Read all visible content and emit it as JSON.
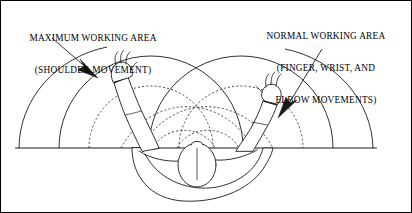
{
  "diagram": {
    "labels": {
      "maximum": {
        "name": "maximum-working-area-label",
        "line1": "MAXIMUM WORKING AREA",
        "line2": "(SHOULDER MOVEMENT)"
      },
      "normal": {
        "name": "normal-working-area-label",
        "line1": "NORMAL WORKING AREA",
        "line2": "(FINGER, WRIST, AND",
        "line3": "ELBOW MOVEMENTS)"
      }
    },
    "icons": {
      "left_leader": "arrow-icon",
      "right_leader": "arrow-icon"
    },
    "colors": {
      "stroke": "#1a1a1a",
      "background": "#ffffff",
      "border": "#000000"
    },
    "geometry": {
      "baseline_y": 147,
      "baseline_x_start": 14,
      "baseline_x_end": 376,
      "left_shoulder_x": 150,
      "right_shoulder_x": 240,
      "maximum_radius": 92,
      "normal_radius": 62,
      "head_center_x": 196,
      "head_center_y": 163
    }
  }
}
